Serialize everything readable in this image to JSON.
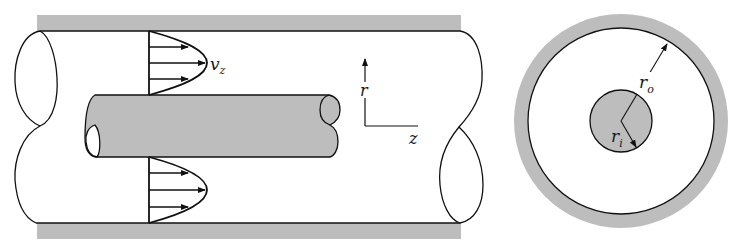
{
  "figure": {
    "colors": {
      "wall_fill": "#bdbdbd",
      "line": "#111111",
      "background": "#ffffff"
    }
  },
  "side_view": {
    "velocity_label": "v",
    "velocity_subscript": "z",
    "axis_r_label": "r",
    "axis_z_label": "z"
  },
  "cross_section": {
    "outer_radius_label": "r",
    "outer_radius_subscript": "o",
    "inner_radius_label": "r",
    "inner_radius_subscript": "i"
  }
}
